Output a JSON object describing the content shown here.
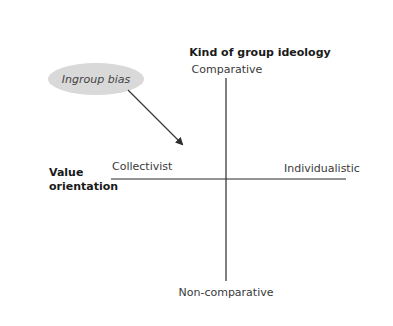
{
  "diagram": {
    "title": "Kind of group ideology",
    "vertical_axis": {
      "top_label": "Comparative",
      "bottom_label": "Non-comparative"
    },
    "horizontal_axis": {
      "title_line1": "Value",
      "title_line2": "orientation",
      "left_label": "Collectivist",
      "right_label": "Individualistic"
    },
    "bubble": {
      "label": "Ingroup bias",
      "fill": "#d9d9d9",
      "points_to": "Collectivist-Comparative quadrant"
    },
    "colors": {
      "axis": "#2a2a2a",
      "arrow": "#3a3a3a",
      "background": "#ffffff"
    }
  }
}
